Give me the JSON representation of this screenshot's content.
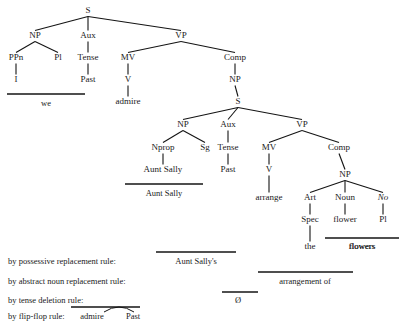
{
  "figure": {
    "background_color": "#ffffff",
    "ink_color": "#141414"
  },
  "tree": {
    "nodes": [
      {
        "id": "S1",
        "label": "S",
        "x": 88,
        "y": 13
      },
      {
        "id": "NP1",
        "label": "NP",
        "x": 35,
        "y": 38
      },
      {
        "id": "Aux1",
        "label": "Aux",
        "x": 88,
        "y": 38
      },
      {
        "id": "VP1",
        "label": "VP",
        "x": 181,
        "y": 38
      },
      {
        "id": "PPn",
        "label": "PPn",
        "x": 16,
        "y": 60
      },
      {
        "id": "Pl1",
        "label": "Pl",
        "x": 58,
        "y": 60
      },
      {
        "id": "Tense1",
        "label": "Tense",
        "x": 88,
        "y": 60
      },
      {
        "id": "MV1",
        "label": "MV",
        "x": 128,
        "y": 60
      },
      {
        "id": "Comp1",
        "label": "Comp",
        "x": 235,
        "y": 60
      },
      {
        "id": "I",
        "label": "I",
        "x": 16,
        "y": 82
      },
      {
        "id": "Past1",
        "label": "Past",
        "x": 88,
        "y": 82
      },
      {
        "id": "V1",
        "label": "V",
        "x": 128,
        "y": 82
      },
      {
        "id": "NP2",
        "label": "NP",
        "x": 235,
        "y": 82
      },
      {
        "id": "admire",
        "label": "admire",
        "x": 128,
        "y": 104
      },
      {
        "id": "S2",
        "label": "S",
        "x": 238,
        "y": 104
      },
      {
        "id": "NP3",
        "label": "NP",
        "x": 183,
        "y": 127
      },
      {
        "id": "Aux2",
        "label": "Aux",
        "x": 228,
        "y": 127
      },
      {
        "id": "VP2",
        "label": "VP",
        "x": 302,
        "y": 127
      },
      {
        "id": "Nprop",
        "label": "Nprop",
        "x": 163,
        "y": 150
      },
      {
        "id": "Sg",
        "label": "Sg",
        "x": 205,
        "y": 150
      },
      {
        "id": "Tense2",
        "label": "Tense",
        "x": 228,
        "y": 150
      },
      {
        "id": "MV2",
        "label": "MV",
        "x": 269,
        "y": 150
      },
      {
        "id": "Comp2",
        "label": "Comp",
        "x": 339,
        "y": 150
      },
      {
        "id": "AuntSally",
        "label": "Aunt Sally",
        "x": 163,
        "y": 172
      },
      {
        "id": "Past2",
        "label": "Past",
        "x": 228,
        "y": 172
      },
      {
        "id": "V2",
        "label": "V",
        "x": 269,
        "y": 172
      },
      {
        "id": "NP4",
        "label": "NP",
        "x": 345,
        "y": 177
      },
      {
        "id": "arrange",
        "label": "arrange",
        "x": 269,
        "y": 200
      },
      {
        "id": "Art",
        "label": "Art",
        "x": 310,
        "y": 200
      },
      {
        "id": "Noun",
        "label": "Noun",
        "x": 345,
        "y": 200
      },
      {
        "id": "No",
        "label": "No",
        "x": 383,
        "y": 200,
        "italic": true
      },
      {
        "id": "Spec",
        "label": "Spec",
        "x": 310,
        "y": 222
      },
      {
        "id": "flower",
        "label": "flower",
        "x": 345,
        "y": 222
      },
      {
        "id": "Pl2",
        "label": "Pl",
        "x": 383,
        "y": 222
      },
      {
        "id": "the",
        "label": "the",
        "x": 310,
        "y": 249
      },
      {
        "id": "flowers",
        "label": "flowers",
        "x": 362,
        "y": 249
      }
    ],
    "edges": [
      {
        "from": "S1",
        "to": "NP1"
      },
      {
        "from": "S1",
        "to": "Aux1"
      },
      {
        "from": "S1",
        "to": "VP1"
      },
      {
        "from": "NP1",
        "to": "PPn"
      },
      {
        "from": "NP1",
        "to": "Pl1"
      },
      {
        "from": "Aux1",
        "to": "Tense1"
      },
      {
        "from": "VP1",
        "to": "MV1"
      },
      {
        "from": "VP1",
        "to": "Comp1"
      },
      {
        "from": "PPn",
        "to": "I"
      },
      {
        "from": "Tense1",
        "to": "Past1"
      },
      {
        "from": "MV1",
        "to": "V1"
      },
      {
        "from": "Comp1",
        "to": "NP2"
      },
      {
        "from": "V1",
        "to": "admire"
      },
      {
        "from": "NP2",
        "to": "S2"
      },
      {
        "from": "S2",
        "to": "NP3"
      },
      {
        "from": "S2",
        "to": "Aux2"
      },
      {
        "from": "S2",
        "to": "VP2"
      },
      {
        "from": "NP3",
        "to": "Nprop"
      },
      {
        "from": "NP3",
        "to": "Sg"
      },
      {
        "from": "Aux2",
        "to": "Tense2"
      },
      {
        "from": "VP2",
        "to": "MV2"
      },
      {
        "from": "VP2",
        "to": "Comp2"
      },
      {
        "from": "Nprop",
        "to": "AuntSally"
      },
      {
        "from": "Tense2",
        "to": "Past2"
      },
      {
        "from": "MV2",
        "to": "V2"
      },
      {
        "from": "Comp2",
        "to": "NP4"
      },
      {
        "from": "V2",
        "to": "arrange"
      },
      {
        "from": "NP4",
        "to": "Art"
      },
      {
        "from": "NP4",
        "to": "Noun"
      },
      {
        "from": "NP4",
        "to": "No"
      },
      {
        "from": "Art",
        "to": "Spec"
      },
      {
        "from": "Noun",
        "to": "flower"
      },
      {
        "from": "No",
        "to": "Pl2"
      },
      {
        "from": "Spec",
        "to": "the"
      }
    ],
    "morpheme_bars": [
      {
        "id": "bar-we",
        "x1": 7,
        "x2": 85,
        "y": 94,
        "word": "we",
        "word_x": 46,
        "word_y": 106
      },
      {
        "id": "bar-auntsally",
        "x1": 125,
        "x2": 203,
        "y": 184,
        "word": "Aunt Sally",
        "word_x": 164,
        "word_y": 196
      },
      {
        "id": "bar-flowers",
        "x1": 325,
        "x2": 399,
        "y": 238,
        "word": "flowers",
        "word_x": 362,
        "word_y": 249
      }
    ]
  },
  "rules": [
    {
      "id": "possessive",
      "label": "by possessive replacement rule:",
      "label_x": 8,
      "label_y": 264,
      "value": "Aunt Sally's",
      "value_x": 196,
      "value_y": 264,
      "bar_x1": 156,
      "bar_x2": 236,
      "bar_y": 252
    },
    {
      "id": "abstract-noun",
      "label": "by abstract noun replacement rule:",
      "label_x": 8,
      "label_y": 284,
      "value": "arrangement of",
      "value_x": 305,
      "value_y": 284,
      "bar_x1": 258,
      "bar_x2": 353,
      "bar_y": 272
    },
    {
      "id": "tense-deletion",
      "label": "by tense deletion rule:",
      "label_x": 8,
      "label_y": 303,
      "value": "Ø",
      "value_x": 238,
      "value_y": 303,
      "bar_x1": 222,
      "bar_x2": 258,
      "bar_y": 292
    },
    {
      "id": "flip-flop",
      "label": "by flip-flop rule:",
      "label_x": 8,
      "label_y": 319,
      "value": "",
      "value_x": 0,
      "value_y": 0,
      "bar_x1": 71,
      "bar_x2": 140,
      "bar_y": 307
    }
  ],
  "flip_flop": {
    "word_one": "admire",
    "word_one_x": 92,
    "word_one_y": 319,
    "word_two": "Past",
    "word_two_x": 133,
    "word_two_y": 319,
    "arc_start_x": 104,
    "arc_end_x": 134,
    "arc_y": 312,
    "arc_peak_y": 306
  }
}
